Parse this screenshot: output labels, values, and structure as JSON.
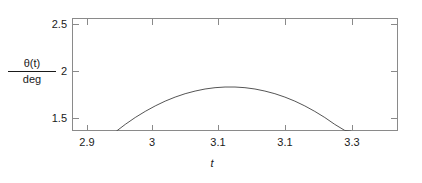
{
  "chart_data": {
    "type": "line",
    "title": "",
    "xlabel": "t",
    "ylabel_numerator": "θ(t)",
    "ylabel_denominator": "deg",
    "xlim": [
      2.88,
      3.37
    ],
    "ylim": [
      1.37,
      2.57
    ],
    "grid": false,
    "legend": null,
    "xticks": [
      {
        "label": "2.9",
        "value": 2.9
      },
      {
        "label": "3",
        "value": 3.0
      },
      {
        "label": "3.1",
        "value": 3.1
      },
      {
        "label": "3.1",
        "value": 3.2
      },
      {
        "label": "3.3",
        "value": 3.3
      }
    ],
    "yticks": [
      {
        "label": "2.5",
        "value": 2.5
      },
      {
        "label": "2",
        "value": 2.0
      },
      {
        "label": "1.5",
        "value": 1.5
      }
    ],
    "series": [
      {
        "name": "theta(t)",
        "color": "#555555",
        "x": [
          2.947,
          2.96,
          2.975,
          2.99,
          3.005,
          3.02,
          3.035,
          3.05,
          3.065,
          3.08,
          3.095,
          3.11,
          3.125,
          3.14,
          3.155,
          3.17,
          3.185,
          3.2,
          3.215,
          3.23,
          3.245,
          3.26,
          3.275,
          3.29,
          3.299
        ],
        "y": [
          1.37,
          1.44,
          1.513,
          1.578,
          1.636,
          1.687,
          1.73,
          1.766,
          1.794,
          1.816,
          1.83,
          1.837,
          1.837,
          1.83,
          1.816,
          1.794,
          1.766,
          1.73,
          1.687,
          1.636,
          1.578,
          1.513,
          1.44,
          1.376,
          1.37
        ]
      }
    ]
  },
  "axes": {
    "frame_color": "#8a8a8a"
  }
}
